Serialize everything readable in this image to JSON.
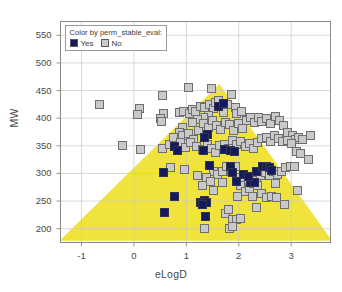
{
  "chart_data": {
    "type": "scatter",
    "title": "",
    "xlabel": "eLogD",
    "ylabel": "MW",
    "xlim": [
      -1.4,
      3.75
    ],
    "ylim": [
      175,
      575
    ],
    "xticks": [
      -1,
      0,
      1,
      2,
      3
    ],
    "yticks": [
      200,
      250,
      300,
      350,
      400,
      450,
      500,
      550
    ],
    "xticklabels": [
      "-1",
      "0",
      "1",
      "2",
      "3"
    ],
    "yticklabels": [
      "200",
      "250",
      "300",
      "350",
      "400",
      "450",
      "500",
      "550"
    ],
    "grid": true,
    "legend_position": "top-left",
    "legend": {
      "title": "Color by perm_stable_eval:",
      "entries": [
        {
          "label": "Yes",
          "color": "#151a5e"
        },
        {
          "label": "No",
          "color": "#c9c9c9"
        }
      ]
    },
    "shaded_region": {
      "name": "desirable-space-triangle",
      "color": "#F0E43C",
      "shape": "triangle",
      "vertices": [
        [
          -1.42,
          178
        ],
        [
          1.63,
          462
        ],
        [
          3.78,
          178
        ]
      ]
    },
    "series": [
      {
        "name": "Yes",
        "color": "#151a5e",
        "points": [
          [
            1.62,
            421
          ],
          [
            1.7,
            426
          ],
          [
            1.4,
            370
          ],
          [
            1.34,
            366
          ],
          [
            0.78,
            348
          ],
          [
            0.84,
            342
          ],
          [
            1.33,
            342
          ],
          [
            1.73,
            344
          ],
          [
            1.85,
            342
          ],
          [
            1.92,
            339
          ],
          [
            0.57,
            302
          ],
          [
            1.45,
            314
          ],
          [
            1.84,
            313
          ],
          [
            1.88,
            302
          ],
          [
            2.22,
            284
          ],
          [
            2.33,
            303
          ],
          [
            2.45,
            312
          ],
          [
            2.52,
            313
          ],
          [
            2.58,
            311
          ],
          [
            2.62,
            305
          ],
          [
            2.3,
            283
          ],
          [
            0.77,
            258
          ],
          [
            1.27,
            248
          ],
          [
            1.35,
            251
          ],
          [
            1.38,
            247
          ],
          [
            1.3,
            244
          ],
          [
            1.36,
            223
          ],
          [
            0.58,
            229
          ],
          [
            2.09,
            299
          ],
          [
            1.96,
            286
          ],
          [
            2.18,
            295
          ]
        ]
      },
      {
        "name": "No",
        "color": "#c9c9c9",
        "points": [
          [
            -0.65,
            424
          ],
          [
            0.1,
            418
          ],
          [
            0.07,
            406
          ],
          [
            0.55,
            442
          ],
          [
            0.56,
            408
          ],
          [
            0.5,
            400
          ],
          [
            0.53,
            394
          ],
          [
            1.05,
            455
          ],
          [
            1.47,
            453
          ],
          [
            0.86,
            411
          ],
          [
            0.95,
            413
          ],
          [
            1.06,
            409
          ],
          [
            1.12,
            415
          ],
          [
            1.18,
            412
          ],
          [
            1.27,
            421
          ],
          [
            1.35,
            419
          ],
          [
            1.45,
            424
          ],
          [
            1.52,
            418
          ],
          [
            1.55,
            428
          ],
          [
            1.62,
            432
          ],
          [
            1.7,
            410
          ],
          [
            1.78,
            425
          ],
          [
            1.86,
            443
          ],
          [
            1.94,
            419
          ],
          [
            1.96,
            408
          ],
          [
            2.06,
            412
          ],
          [
            1.42,
            405
          ],
          [
            1.32,
            402
          ],
          [
            1.22,
            397
          ],
          [
            1.12,
            392
          ],
          [
            0.92,
            383
          ],
          [
            0.86,
            374
          ],
          [
            0.93,
            368
          ],
          [
            1.04,
            373
          ],
          [
            1.14,
            362
          ],
          [
            1.24,
            378
          ],
          [
            1.33,
            390
          ],
          [
            1.42,
            384
          ],
          [
            1.5,
            396
          ],
          [
            1.58,
            386
          ],
          [
            1.66,
            380
          ],
          [
            1.74,
            393
          ],
          [
            1.82,
            388
          ],
          [
            1.9,
            378
          ],
          [
            2.0,
            390
          ],
          [
            2.08,
            382
          ],
          [
            2.14,
            396
          ],
          [
            2.22,
            401
          ],
          [
            2.3,
            392
          ],
          [
            2.38,
            402
          ],
          [
            2.44,
            394
          ],
          [
            2.52,
            400
          ],
          [
            2.6,
            390
          ],
          [
            2.7,
            403
          ],
          [
            2.78,
            396
          ],
          [
            2.86,
            386
          ],
          [
            2.92,
            375
          ],
          [
            3.02,
            368
          ],
          [
            3.08,
            362
          ],
          [
            3.14,
            365
          ],
          [
            3.22,
            362
          ],
          [
            3.36,
            369
          ],
          [
            -0.22,
            350
          ],
          [
            0.12,
            343
          ],
          [
            0.55,
            345
          ],
          [
            0.68,
            352
          ],
          [
            0.76,
            366
          ],
          [
            0.88,
            356
          ],
          [
            0.98,
            347
          ],
          [
            1.08,
            356
          ],
          [
            1.2,
            348
          ],
          [
            1.3,
            344
          ],
          [
            1.4,
            352
          ],
          [
            1.48,
            345
          ],
          [
            1.56,
            338
          ],
          [
            1.64,
            350
          ],
          [
            1.72,
            352
          ],
          [
            1.8,
            346
          ],
          [
            1.88,
            360
          ],
          [
            1.96,
            352
          ],
          [
            2.04,
            358
          ],
          [
            2.12,
            349
          ],
          [
            2.2,
            355
          ],
          [
            2.28,
            346
          ],
          [
            2.36,
            356
          ],
          [
            2.44,
            364
          ],
          [
            2.52,
            366
          ],
          [
            2.6,
            358
          ],
          [
            2.68,
            368
          ],
          [
            2.76,
            364
          ],
          [
            2.84,
            357
          ],
          [
            2.92,
            360
          ],
          [
            3.0,
            355
          ],
          [
            3.1,
            340
          ],
          [
            3.18,
            336
          ],
          [
            3.32,
            326
          ],
          [
            0.7,
            310
          ],
          [
            0.96,
            308
          ],
          [
            1.22,
            296
          ],
          [
            1.52,
            304
          ],
          [
            1.6,
            298
          ],
          [
            1.68,
            304
          ],
          [
            1.76,
            312
          ],
          [
            1.86,
            304
          ],
          [
            1.94,
            312
          ],
          [
            2.02,
            292
          ],
          [
            2.1,
            286
          ],
          [
            2.18,
            290
          ],
          [
            2.26,
            294
          ],
          [
            2.34,
            288
          ],
          [
            2.42,
            296
          ],
          [
            2.5,
            302
          ],
          [
            2.58,
            296
          ],
          [
            2.66,
            304
          ],
          [
            2.74,
            298
          ],
          [
            2.82,
            304
          ],
          [
            2.9,
            310
          ],
          [
            2.98,
            313
          ],
          [
            3.06,
            312
          ],
          [
            1.3,
            278
          ],
          [
            2.04,
            278
          ],
          [
            2.12,
            268
          ],
          [
            2.2,
            272
          ],
          [
            2.28,
            282
          ],
          [
            2.36,
            278
          ],
          [
            1.98,
            258
          ],
          [
            2.26,
            258
          ],
          [
            2.44,
            264
          ],
          [
            2.52,
            256
          ],
          [
            2.62,
            258
          ],
          [
            2.72,
            256
          ],
          [
            3.12,
            270
          ],
          [
            1.74,
            228
          ],
          [
            1.8,
            234
          ],
          [
            1.88,
            216
          ],
          [
            1.96,
            216
          ],
          [
            2.04,
            218
          ],
          [
            1.82,
            200
          ],
          [
            1.88,
            204
          ],
          [
            1.34,
            200
          ],
          [
            2.34,
            238
          ],
          [
            2.88,
            244
          ],
          [
            1.38,
            292
          ],
          [
            1.46,
            286
          ],
          [
            2.7,
            282
          ],
          [
            1.52,
            270
          ],
          [
            1.68,
            284
          ]
        ]
      }
    ]
  }
}
